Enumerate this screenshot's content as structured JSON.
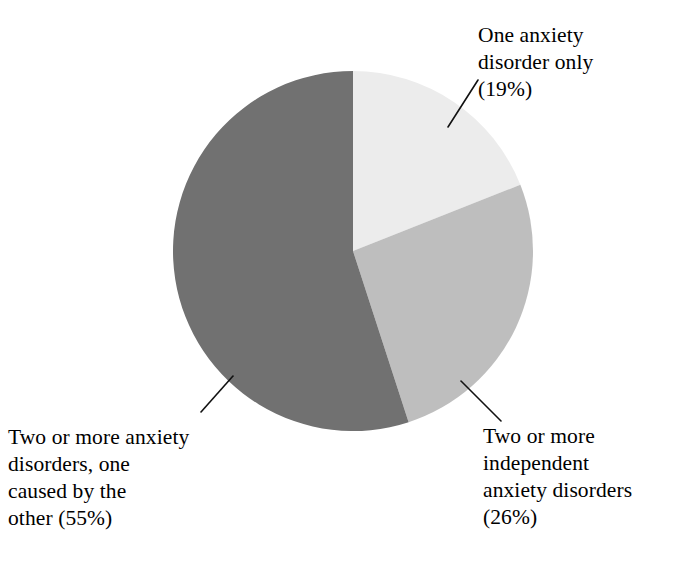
{
  "figure": {
    "background_color": "#ffffff",
    "text_color": "#000000",
    "width": 681,
    "height": 563
  },
  "chart_data": {
    "type": "pie",
    "title": "",
    "subtitle": "",
    "xlabel": "",
    "ylabel": "",
    "grid": false,
    "legend_position": "callout-labels",
    "units": "percent",
    "start_angle_deg": 0,
    "direction": "clockwise",
    "center": {
      "x": 353,
      "y": 251
    },
    "radius": 180,
    "categories": [
      "One anxiety disorder only",
      "Two or more independent anxiety disorders",
      "Two or more anxiety disorders, one caused by the other"
    ],
    "values": [
      19,
      26,
      55
    ],
    "slices": [
      {
        "name": "one-anxiety-disorder-only",
        "label": "One anxiety disorder only",
        "value": 19,
        "value_text": "(19%)",
        "color": "#ececec",
        "start_angle_deg": 0,
        "end_angle_deg": 68.4
      },
      {
        "name": "two-or-more-independent",
        "label": "Two or more independent anxiety disorders",
        "value": 26,
        "value_text": "(26%)",
        "color": "#bebebe",
        "start_angle_deg": 68.4,
        "end_angle_deg": 162.0
      },
      {
        "name": "two-or-more-one-caused-by-other",
        "label": "Two or more anxiety disorders, one caused by the other",
        "value": 55,
        "value_text": "(55%)",
        "color": "#717171",
        "start_angle_deg": 162.0,
        "end_angle_deg": 360.0
      }
    ]
  },
  "labels": {
    "one_anxiety_disorder_only": "One anxiety\ndisorder only\n(19%)",
    "two_or_more_caused": "Two or more anxiety\ndisorders, one\ncaused by the\nother (55%)",
    "two_or_more_independent": "Two or more\nindependent\nanxiety disorders\n(26%)"
  },
  "leader_lines": [
    {
      "name": "leader-line-one-anxiety-disorder-only",
      "x1": 448,
      "y1": 127,
      "x2": 478,
      "y2": 80,
      "color": "#111111",
      "width": 1.6
    },
    {
      "name": "leader-line-two-or-more-caused",
      "x1": 233,
      "y1": 376,
      "x2": 201,
      "y2": 412,
      "color": "#111111",
      "width": 1.6
    },
    {
      "name": "leader-line-two-or-more-independent",
      "x1": 461,
      "y1": 381,
      "x2": 501,
      "y2": 421,
      "color": "#111111",
      "width": 1.6
    }
  ]
}
